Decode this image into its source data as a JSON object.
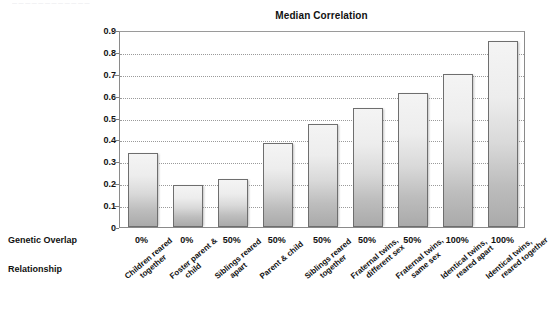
{
  "crop_artifact_text": "— — — — — — — — — — — —",
  "chart_data": {
    "type": "bar",
    "title": "Median Correlation",
    "xlabel": "",
    "ylabel": "",
    "ylim": [
      0,
      0.9
    ],
    "grid": true,
    "legend": false,
    "ytick_labels": [
      "0.9",
      "0.8",
      "0.7",
      "0.6",
      "0.5",
      "0.4",
      "0.3",
      "0.2",
      "0.1",
      "0"
    ],
    "ytick_values": [
      0.9,
      0.8,
      0.7,
      0.6,
      0.5,
      0.4,
      0.3,
      0.2,
      0.1,
      0
    ],
    "categories": [
      "Children reared together",
      "Foster parent & child",
      "Siblings reared apart",
      "Parent & child",
      "Siblings reared together",
      "Fraternal twins, different sex",
      "Fraternal twins, same sex",
      "Identical twins, reared apart",
      "Identical twins, reared together"
    ],
    "values": [
      0.34,
      0.19,
      0.22,
      0.385,
      0.47,
      0.545,
      0.61,
      0.7,
      0.85
    ],
    "bar_color": "#d8d8d8",
    "bar_border_color": "#6e6e6e"
  },
  "axis_rows": {
    "genetic_overlap": {
      "label": "Genetic Overlap",
      "values": [
        "0%",
        "0%",
        "50%",
        "50%",
        "50%",
        "50%",
        "50%",
        "100%",
        "100%"
      ]
    },
    "relationship": {
      "label": "Relationship",
      "values": [
        {
          "line1": "Children reared",
          "line2": "together"
        },
        {
          "line1": "Foster parent &",
          "line2": "child"
        },
        {
          "line1": "Siblings reared",
          "line2": "apart"
        },
        {
          "line1": "Parent & child",
          "line2": ""
        },
        {
          "line1": "Siblings reared",
          "line2": "together"
        },
        {
          "line1": "Fraternal twins,",
          "line2": "different sex"
        },
        {
          "line1": "Fraternal twins,",
          "line2": "same sex"
        },
        {
          "line1": "Identical twins,",
          "line2": "reared apart"
        },
        {
          "line1": "Identical twins,",
          "line2": "reared together"
        }
      ]
    }
  }
}
